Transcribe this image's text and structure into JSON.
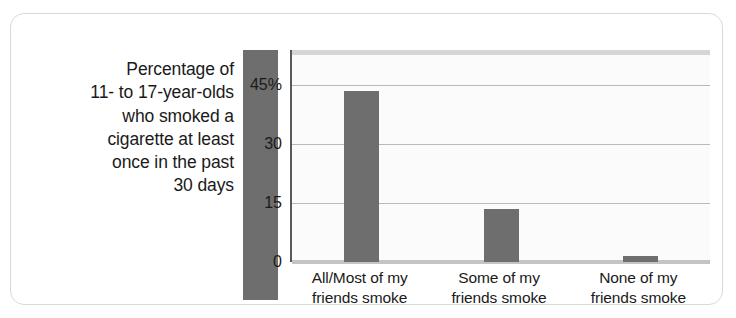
{
  "card": {
    "border_color": "#d9d9d9",
    "background": "#ffffff"
  },
  "axis_caption": {
    "lines": [
      "Percentage of",
      "11- to 17-year-olds",
      "who smoked a",
      "cigarette at least",
      "once in the past",
      "30 days"
    ]
  },
  "chart_data": {
    "type": "bar",
    "title": "",
    "subtitle": "",
    "xlabel": "",
    "ylabel": "Percentage of 11- to 17-year-olds who smoked a cigarette at least once in the past 30 days",
    "categories": [
      "All/Most of my friends smoke",
      "Some of my friends smoke",
      "None of my friends smoke"
    ],
    "category_lines": [
      [
        "All/Most of my",
        "friends smoke"
      ],
      [
        "Some of my",
        "friends smoke"
      ],
      [
        "None of my",
        "friends smoke"
      ]
    ],
    "values": [
      43.5,
      13.5,
      1.5
    ],
    "ylim": [
      0,
      54
    ],
    "yticks": [
      0,
      15,
      30,
      45
    ],
    "ytick_labels": [
      "0",
      "15",
      "30",
      "45%"
    ],
    "grid": true,
    "legend": false,
    "bar_color": "#6e6e6e",
    "plot_background": "#fbfbfb",
    "gridline_color": "#b9b9b9",
    "axis_color": "#58595b"
  }
}
